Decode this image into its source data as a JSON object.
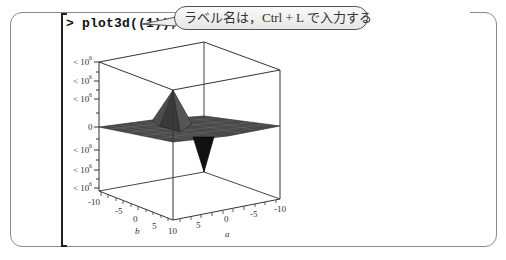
{
  "worksheet": {
    "prompt_symbol": ">",
    "command": "plot3d((1));",
    "command_display": "> plot3d((1));"
  },
  "callout": {
    "text": "ラベル名は，Ctrl + L で入力する"
  },
  "plot": {
    "type": "plot3d surface",
    "z_axis_ticks": [
      "< 10⁶",
      "< 10⁶",
      "< 10⁶",
      "0",
      "< 10⁶",
      "< 10⁶",
      "< 10⁶"
    ],
    "z_tick_label_raw": "< 10",
    "z_tick_exp": "6",
    "z_zero": "0",
    "b_axis": {
      "label": "b",
      "ticks": [
        "-10",
        "-5",
        "0",
        "5",
        "10"
      ]
    },
    "a_axis": {
      "label": "a",
      "ticks": [
        "10",
        "5",
        "0",
        "-5",
        "-10"
      ]
    },
    "colors": {
      "surface": "#3c3c3c",
      "surface_dark": "#111111",
      "axes": "#333333"
    }
  }
}
